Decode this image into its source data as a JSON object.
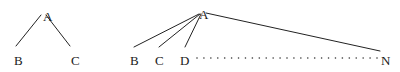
{
  "figure": {
    "background_color": "#ffffff",
    "ink_color": "#222222",
    "trees": [
      {
        "id": "binary-branching-tree",
        "root": {
          "label": "A",
          "x": 43,
          "y": 10
        },
        "children": [
          {
            "label": "B",
            "x": 14,
            "y": 54
          },
          {
            "label": "C",
            "x": 71,
            "y": 54
          }
        ],
        "edges": [
          {
            "from": "A",
            "to": "B",
            "x1": 41,
            "y1": 15,
            "x2": 16,
            "y2": 46
          },
          {
            "from": "A",
            "to": "C",
            "x1": 46,
            "y1": 15,
            "x2": 70,
            "y2": 46
          }
        ],
        "has_ellipsis": false
      },
      {
        "id": "n-ary-branching-tree",
        "root": {
          "label": "A",
          "x": 199,
          "y": 8
        },
        "children": [
          {
            "label": "B",
            "x": 130,
            "y": 54
          },
          {
            "label": "C",
            "x": 155,
            "y": 54
          },
          {
            "label": "D",
            "x": 180,
            "y": 54
          },
          {
            "label": "N",
            "x": 381,
            "y": 54
          }
        ],
        "edges": [
          {
            "from": "A",
            "to": "B",
            "x1": 199,
            "y1": 14,
            "x2": 134,
            "y2": 47
          },
          {
            "from": "A",
            "to": "C",
            "x1": 200,
            "y1": 14,
            "x2": 159,
            "y2": 47
          },
          {
            "from": "A",
            "to": "D",
            "x1": 201,
            "y1": 14,
            "x2": 185,
            "y2": 47
          },
          {
            "from": "A",
            "to": "N",
            "x1": 206,
            "y1": 13,
            "x2": 380,
            "y2": 51
          }
        ],
        "has_ellipsis": true,
        "ellipsis": {
          "name": "horizontal-dot-ellipsis",
          "start_x": 197,
          "end_x": 377,
          "y": 58,
          "dot_count": 27,
          "dot_radius": 0.8
        }
      }
    ]
  }
}
